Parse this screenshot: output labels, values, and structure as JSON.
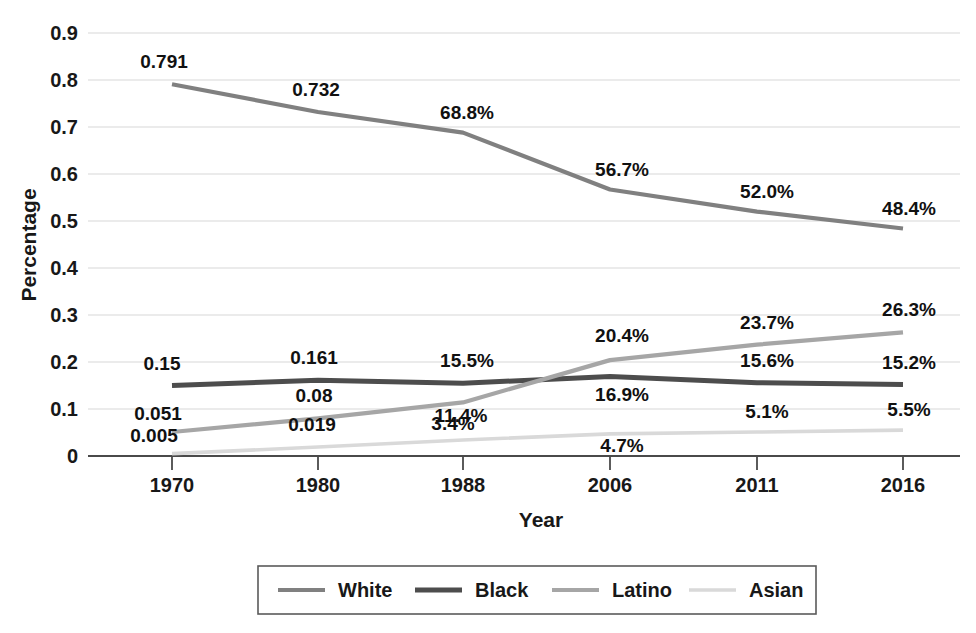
{
  "chart_data": {
    "type": "line",
    "title": "",
    "xlabel": "Year",
    "ylabel": "Percentage",
    "categories": [
      "1970",
      "1980",
      "1988",
      "2006",
      "2011",
      "2016"
    ],
    "ylim": [
      0,
      0.9
    ],
    "ytick_labels": [
      "0",
      "0.1",
      "0.2",
      "0.3",
      "0.4",
      "0.5",
      "0.6",
      "0.7",
      "0.8",
      "0.9"
    ],
    "ytick_values": [
      0,
      0.1,
      0.2,
      0.3,
      0.4,
      0.5,
      0.6,
      0.7,
      0.8,
      0.9
    ],
    "grid": true,
    "legend_position": "bottom",
    "series": [
      {
        "name": "White",
        "color": "#808080",
        "width": 4.2,
        "values": [
          0.791,
          0.732,
          0.688,
          0.567,
          0.52,
          0.484
        ],
        "labels": [
          "0.791",
          "0.732",
          "68.8%",
          "56.7%",
          "52.0%",
          "48.4%"
        ]
      },
      {
        "name": "Black",
        "color": "#4d4d4d",
        "width": 5.0,
        "values": [
          0.15,
          0.161,
          0.155,
          0.169,
          0.156,
          0.152
        ],
        "labels": [
          "0.15",
          "0.161",
          "15.5%",
          "16.9%",
          "15.6%",
          "15.2%"
        ]
      },
      {
        "name": "Latino",
        "color": "#a6a6a6",
        "width": 4.2,
        "values": [
          0.051,
          0.08,
          0.114,
          0.204,
          0.237,
          0.263
        ],
        "labels": [
          "0.051",
          "0.08",
          "11.4%",
          "20.4%",
          "23.7%",
          "26.3%"
        ]
      },
      {
        "name": "Asian",
        "color": "#d9d9d9",
        "width": 3.6,
        "values": [
          0.005,
          0.019,
          0.034,
          0.047,
          0.051,
          0.055
        ],
        "labels": [
          "0.005",
          "0.019",
          "3.4%",
          "4.7%",
          "5.1%",
          "5.5%"
        ]
      }
    ]
  },
  "legend": {
    "items": [
      {
        "label": "White"
      },
      {
        "label": "Black"
      },
      {
        "label": "Latino"
      },
      {
        "label": "Asian"
      }
    ]
  }
}
